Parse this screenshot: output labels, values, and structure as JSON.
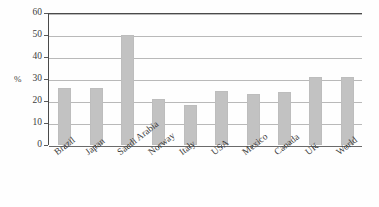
{
  "chart_data": {
    "type": "bar",
    "title": "",
    "xlabel": "",
    "ylabel": "%",
    "ylim": [
      0,
      60
    ],
    "yticks": [
      0,
      10,
      20,
      30,
      40,
      50,
      60
    ],
    "ytick_labels": [
      "0",
      "10",
      "20",
      "30",
      "40",
      "50",
      "60"
    ],
    "grid": true,
    "legend": "none",
    "categories": [
      "Brazil",
      "Japan",
      "Saudi Arabia",
      "Norway",
      "Italy",
      "USA",
      "Mexico",
      "Canada",
      "UK",
      "World"
    ],
    "values": [
      26,
      26,
      50,
      21,
      18,
      24.5,
      23,
      24,
      31,
      31
    ],
    "series": [
      {
        "name": "",
        "values": [
          26,
          26,
          50,
          21,
          18,
          24.5,
          23,
          24,
          31,
          31
        ]
      }
    ],
    "colors": {
      "bar": "#c2c2c2",
      "gridline": "#b9b9b9",
      "axis": "#4a4a4a",
      "text": "#3d3d3d",
      "background": "#fefefe"
    }
  }
}
